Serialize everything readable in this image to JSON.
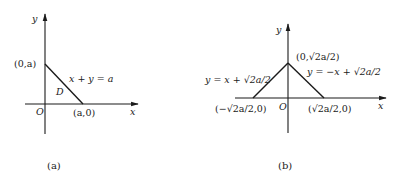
{
  "figures": [
    {
      "id": "a",
      "caption": "(a)",
      "axes": {
        "x_label": "x",
        "y_label": "y",
        "origin_label": "O"
      },
      "points": [
        {
          "name": "y-intercept",
          "label": "(0,a)"
        },
        {
          "name": "x-intercept",
          "label": "(a,0)"
        }
      ],
      "lines": [
        {
          "name": "hypotenuse",
          "equation": "x + y = a"
        }
      ],
      "region_label": "D"
    },
    {
      "id": "b",
      "caption": "(b)",
      "axes": {
        "x_label": "x",
        "y_label": "y",
        "origin_label": "O"
      },
      "points": [
        {
          "name": "apex",
          "label": "(0,√2a/2)"
        },
        {
          "name": "left-base",
          "label": "(−√2a/2,0)"
        },
        {
          "name": "right-base",
          "label": "(√2a/2,0)"
        }
      ],
      "lines": [
        {
          "name": "left-edge",
          "equation": "y = x + √2a/2"
        },
        {
          "name": "right-edge",
          "equation": "y = −x + √2a/2"
        }
      ]
    }
  ]
}
